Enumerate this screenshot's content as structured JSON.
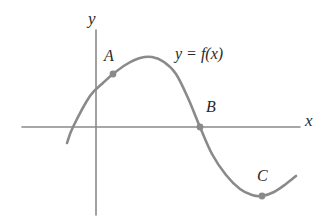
{
  "figure": {
    "kind": "function-graph",
    "background_color": "#ffffff",
    "curve_color": "#8a8a8a",
    "axis_color": "#8a8a8a",
    "point_color": "#8a8a8a",
    "label_color": "#2a2a2a"
  },
  "axes": {
    "x_axis_label": "x",
    "y_axis_label": "y",
    "x_axis": {
      "y": 127,
      "x_start": 22,
      "x_end": 300
    },
    "y_axis": {
      "x": 96,
      "y_start": 30,
      "y_end": 215
    },
    "ticks": [],
    "grid": false
  },
  "function_label": "y = f(x)",
  "points": [
    {
      "name": "A",
      "label": "A",
      "x": 113,
      "y": 74,
      "description": "point on rising branch above y-axis"
    },
    {
      "name": "B",
      "label": "B",
      "x": 200,
      "y": 127,
      "description": "x-intercept on descending branch"
    },
    {
      "name": "C",
      "label": "C",
      "x": 262,
      "y": 196,
      "description": "local minimum of the curve"
    }
  ],
  "chart_data": {
    "type": "line",
    "title": "",
    "subtitle": "",
    "xlabel": "x",
    "ylabel": "y",
    "legend": [
      "y = f(x)"
    ],
    "legend_position": "inline-upper-right",
    "grid": false,
    "axis_ranges": {
      "xlim": [
        22,
        300
      ],
      "ylim": [
        30,
        215
      ]
    },
    "annotations": [
      {
        "text": "y = f(x)",
        "x": 175,
        "y": 57
      },
      {
        "text": "A",
        "x": 110,
        "y": 58
      },
      {
        "text": "B",
        "x": 213,
        "y": 110
      },
      {
        "text": "C",
        "x": 265,
        "y": 180
      }
    ],
    "series": [
      {
        "name": "y = f(x)",
        "color": "#8a8a8a",
        "points": [
          [
            67,
            143
          ],
          [
            73,
            127
          ],
          [
            90,
            96
          ],
          [
            103,
            83
          ],
          [
            113,
            74
          ],
          [
            127,
            64
          ],
          [
            140,
            58
          ],
          [
            152,
            57
          ],
          [
            164,
            62
          ],
          [
            176,
            74
          ],
          [
            188,
            98
          ],
          [
            200,
            127
          ],
          [
            212,
            154
          ],
          [
            226,
            175
          ],
          [
            240,
            189
          ],
          [
            252,
            195
          ],
          [
            262,
            196
          ],
          [
            274,
            192
          ],
          [
            286,
            184
          ],
          [
            296,
            176
          ]
        ]
      }
    ]
  }
}
